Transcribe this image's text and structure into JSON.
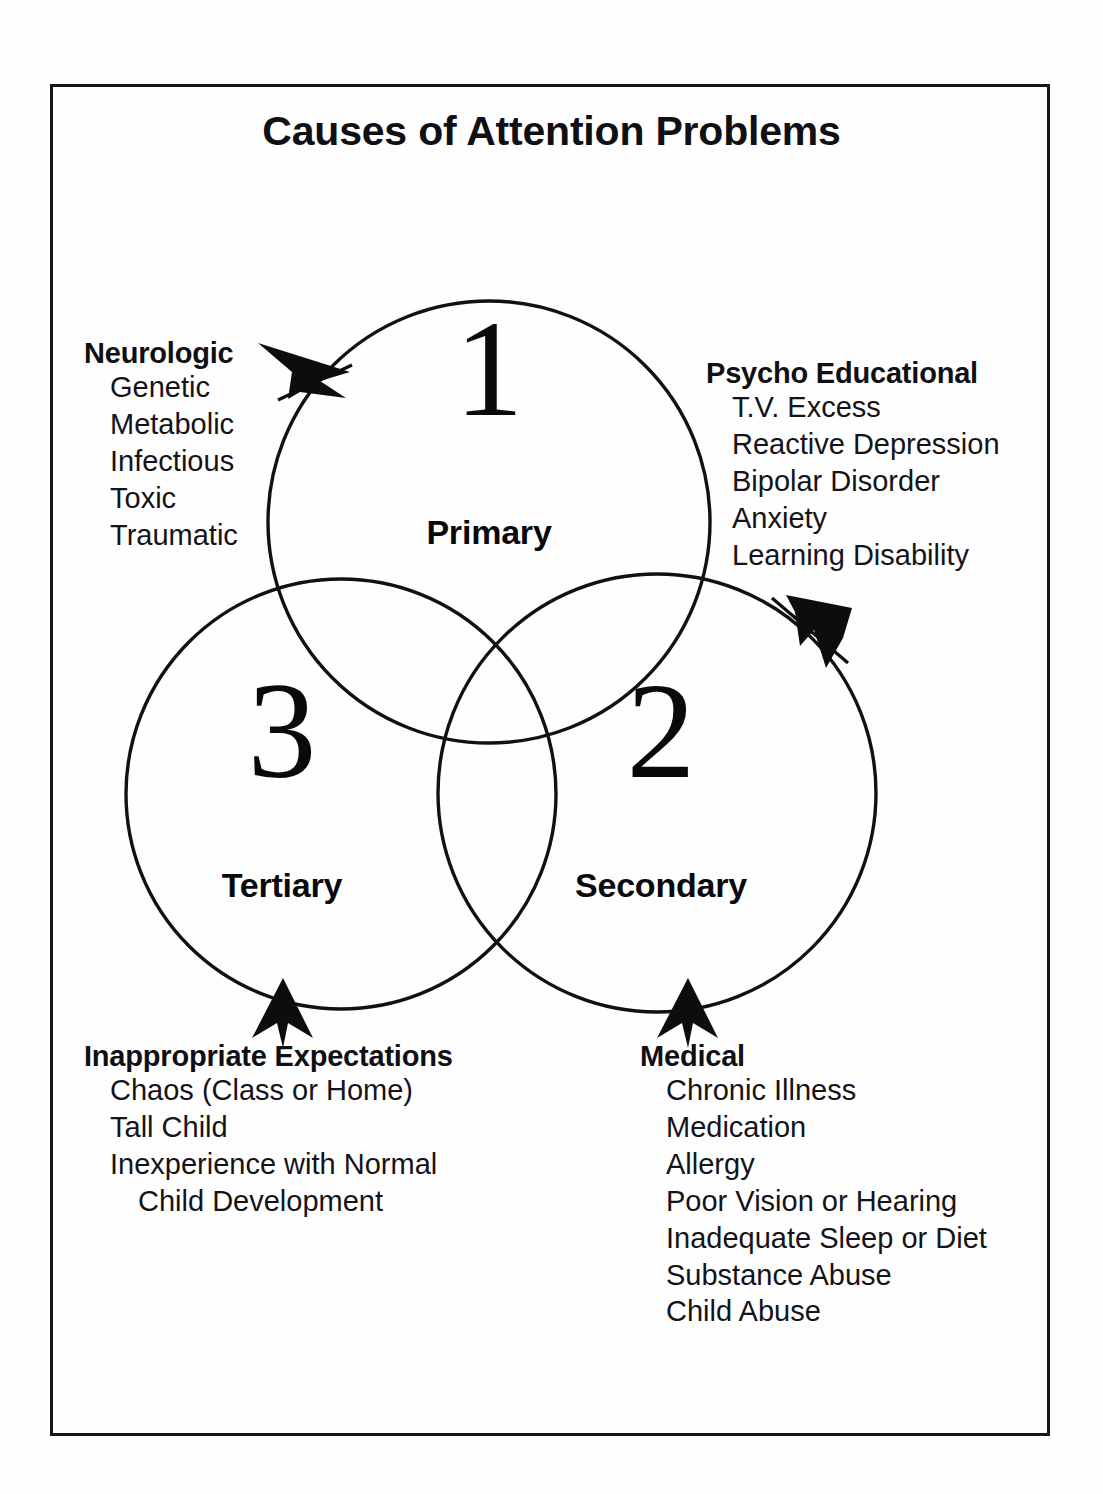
{
  "title": "Causes of Attention Problems",
  "diagram": {
    "type": "venn-3-circle",
    "circles": [
      {
        "numeral": "1",
        "label": "Primary",
        "position": "top"
      },
      {
        "numeral": "2",
        "label": "Secondary",
        "position": "bottom-right"
      },
      {
        "numeral": "3",
        "label": "Tertiary",
        "position": "bottom-left"
      }
    ],
    "stroke_color": "#111111",
    "background_color": "#fefefe"
  },
  "callouts": {
    "neurologic": {
      "heading": "Neurologic",
      "items": [
        "Genetic",
        "Metabolic",
        "Infectious",
        "Toxic",
        "Traumatic"
      ],
      "points_to": "Primary",
      "arrow": "arrow-right-into-primary"
    },
    "psycho_educational": {
      "heading": "Psycho Educational",
      "items": [
        "T.V. Excess",
        "Reactive Depression",
        "Bipolar Disorder",
        "Anxiety",
        "Learning Disability"
      ],
      "points_to": "Secondary",
      "arrow": "arrow-down-left-into-secondary"
    },
    "inappropriate_expectations": {
      "heading": "Inappropriate Expectations",
      "items": [
        "Chaos (Class or Home)",
        "Tall Child",
        "Inexperience with Normal",
        "Child Development"
      ],
      "continuation_index": 3,
      "points_to": "Tertiary",
      "arrow": "arrow-up-into-tertiary"
    },
    "medical": {
      "heading": "Medical",
      "items": [
        "Chronic Illness",
        "Medication",
        "Allergy",
        "Poor Vision or Hearing",
        "Inadequate Sleep or Diet",
        "Substance Abuse",
        "Child Abuse"
      ],
      "points_to": "Secondary",
      "arrow": "arrow-up-into-secondary"
    }
  }
}
